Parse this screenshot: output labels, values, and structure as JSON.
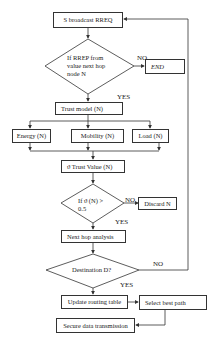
{
  "diagram": {
    "type": "flowchart",
    "colors": {
      "line": "#333333",
      "background": "#ffffff",
      "text": "#1a1a1a"
    },
    "nodes": {
      "broadcast": "S broadcast RREQ",
      "rrep_decision_line1": "If RREP from",
      "rrep_decision_line2": "value next hop",
      "rrep_decision_line3": "node N",
      "end": "END",
      "trust_model": "Trust model (N)",
      "energy": "Energy (N)",
      "mobility": "Mobility (N)",
      "load": "Load (N)",
      "trust_value": "ϑ  Trust Value (N)",
      "threshold_decision_line1": "If ϑ (N) >",
      "threshold_decision_line2": "0.5",
      "discard": "Discard N",
      "next_hop": "Next hop analysis",
      "destination_decision": "Destination D?",
      "update_routing": "Update routing table",
      "select_path": "Select best path",
      "secure_tx": "Secure data transmission"
    },
    "edge_labels": {
      "rrep_no": "NO",
      "rrep_yes": "YES",
      "threshold_no": "NO",
      "threshold_yes": "YES",
      "destination_no": "NO",
      "destination_yes": "YES"
    }
  }
}
